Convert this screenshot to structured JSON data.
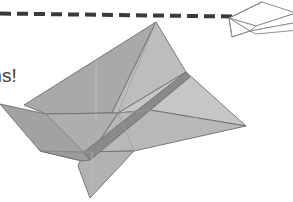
{
  "illustration": {
    "title": "Paper airplane in flight with dashed flight path",
    "background_color": "#ffffff",
    "caption_fragment": "ms!",
    "caption_color": "#3b3b3b"
  },
  "flight_path": {
    "label": "dashed-flight-path",
    "color": "#3a3a3a",
    "thickness_px": 4,
    "dash_length_px": 11,
    "gap_length_px": 6,
    "start_x": 0,
    "start_y": 13,
    "end_x": 232,
    "end_y": 16
  },
  "small_plane": {
    "label": "small-outline-paper-plane",
    "fill_color": "#ffffff",
    "stroke_color": "#8e8e8e",
    "stroke_width_px": 1,
    "bounds": {
      "x": 214,
      "y": 0,
      "width": 79,
      "height": 36
    }
  },
  "large_plane": {
    "label": "large-shaded-paper-plane",
    "outline_color": "#6e6e6e",
    "bounds": {
      "x": 0,
      "y": 21,
      "width": 248,
      "height": 177
    },
    "facets": [
      {
        "name": "upper-left-wing",
        "fill": "#a9a9a9"
      },
      {
        "name": "upper-right-wing",
        "fill": "#bdbdbd"
      },
      {
        "name": "lower-right-wing",
        "fill": "#c3c3c3"
      },
      {
        "name": "body-underside",
        "fill": "#b4b4b4"
      },
      {
        "name": "left-tail-fin",
        "fill": "#a0a0a0"
      },
      {
        "name": "lower-tail-fin",
        "fill": "#b0b0b0"
      },
      {
        "name": "keel-spine",
        "fill": "#8a8a8a"
      }
    ],
    "apex_point": {
      "x": 156,
      "y": 22
    },
    "right_wingtip": {
      "x": 246,
      "y": 126
    },
    "tail_tip": {
      "x": 0,
      "y": 104
    }
  }
}
